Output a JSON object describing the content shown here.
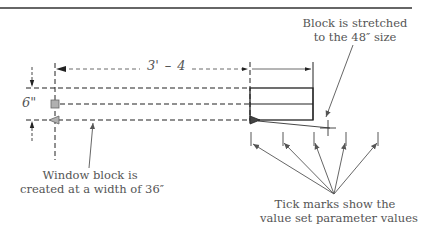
{
  "diagram": {
    "type": "dynamic-block-stretch-illustration",
    "dimensions": {
      "width_label": "3'-4\"",
      "width_part1": "3'",
      "width_part2": "4",
      "height_label": "6\""
    },
    "callouts": {
      "stretched": {
        "line1": "Block is stretched",
        "line2": "to the 48″ size"
      },
      "created": {
        "line1": "Window block is",
        "line2": "created at a width of 36″"
      },
      "ticks": {
        "line1": "Tick marks show the",
        "line2": "value set parameter values"
      }
    },
    "tick_count": 5,
    "colors": {
      "line": "#222222",
      "grip_fill": "#b0b0b0",
      "text": "#555555",
      "arrow": "#555555"
    }
  }
}
